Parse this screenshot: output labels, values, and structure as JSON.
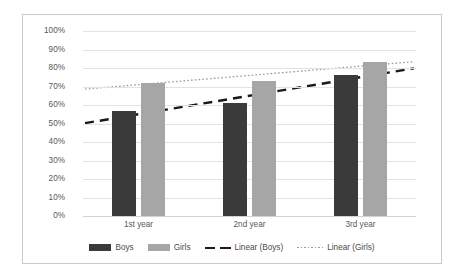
{
  "chart_data": {
    "type": "bar",
    "title": "",
    "xlabel": "",
    "ylabel": "",
    "categories": [
      "1st year",
      "2nd year",
      "3rd year"
    ],
    "series": [
      {
        "name": "Boys",
        "values": [
          57,
          61,
          76
        ],
        "color": "#3a3a3a"
      },
      {
        "name": "Girls",
        "values": [
          72,
          73,
          83
        ],
        "color": "#a6a6a6"
      }
    ],
    "trendlines": [
      {
        "name": "Linear (Boys)",
        "style": "dashed",
        "color": "#1a1a1a",
        "values": [
          55,
          65,
          75
        ]
      },
      {
        "name": "Linear (Girls)",
        "style": "dotted",
        "color": "#9a9a9a",
        "values": [
          71,
          76,
          81
        ]
      }
    ],
    "ylim": [
      0,
      100
    ],
    "ytick_labels": [
      "100%",
      "90%",
      "80%",
      "70%",
      "60%",
      "50%",
      "40%",
      "30%",
      "20%",
      "10%",
      "0%"
    ],
    "ytick_values": [
      100,
      90,
      80,
      70,
      60,
      50,
      40,
      30,
      20,
      10,
      0
    ],
    "grid": true,
    "legend_position": "bottom",
    "legend": [
      "Boys",
      "Girls",
      "Linear (Boys)",
      "Linear (Girls)"
    ]
  }
}
